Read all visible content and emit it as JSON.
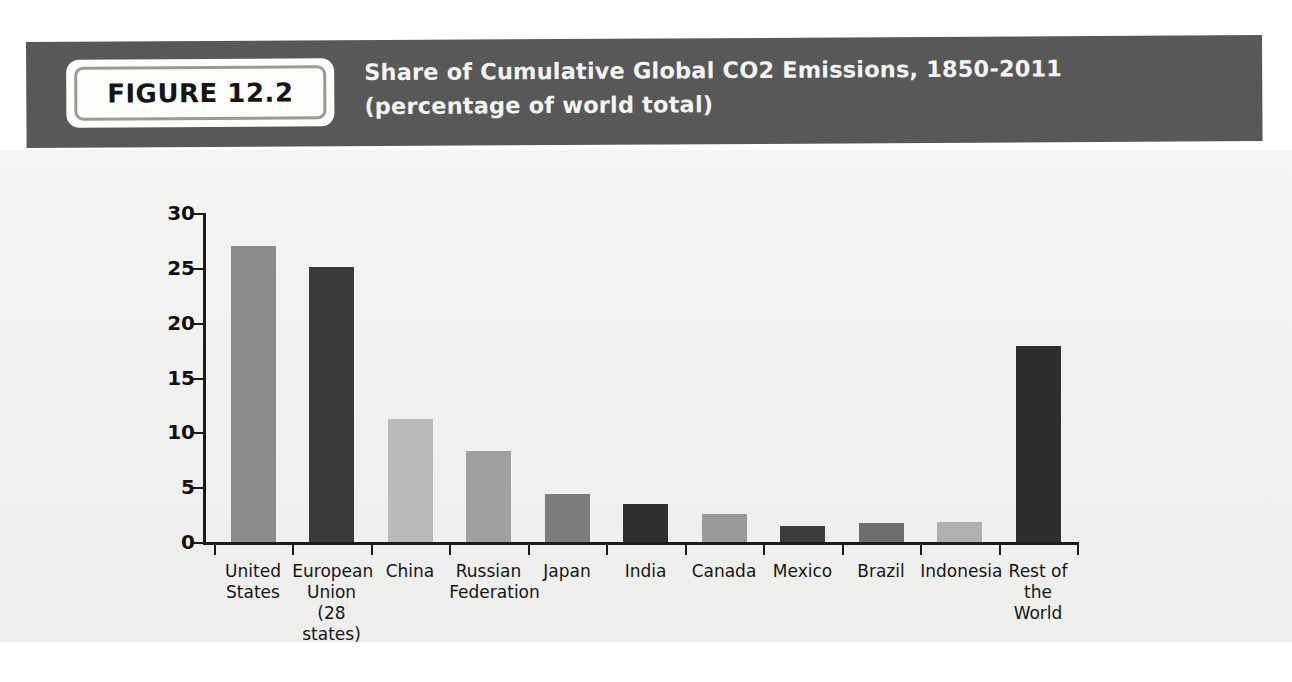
{
  "figure": {
    "badge_label": "FIGURE 12.2",
    "title_line1": "Share of Cumulative Global CO2 Emissions, 1850-2011",
    "title_line2": "(percentage of world total)"
  },
  "colors": {
    "header_band": "#585858",
    "header_text": "#f4f4f2",
    "badge_bg": "#fdfdfb",
    "badge_border": "#9a9a96",
    "axis": "#1b1b1b",
    "paper": "#f1f1ef"
  },
  "chart_data": {
    "type": "bar",
    "title": "Share of Cumulative Global CO2 Emissions, 1850-2011",
    "subtitle": "(percentage of world total)",
    "xlabel": "",
    "ylabel": "",
    "ylim": [
      0,
      30
    ],
    "yticks": [
      0,
      5,
      10,
      15,
      20,
      25,
      30
    ],
    "ytick_labels": [
      "0",
      "5",
      "10",
      "15",
      "20",
      "25",
      "30"
    ],
    "grid": false,
    "legend": "none",
    "categories": [
      "United\nStates",
      "European\nUnion\n(28 states)",
      "China",
      "Russian\nFederation",
      "Japan",
      "India",
      "Canada",
      "Mexico",
      "Brazil",
      "Indonesia",
      "Rest of\nthe World"
    ],
    "values": [
      27.0,
      25.1,
      11.2,
      8.3,
      4.4,
      3.5,
      2.6,
      1.5,
      1.7,
      1.8,
      17.9
    ],
    "bar_colors": [
      "#8b8b8b",
      "#3a3a3a",
      "#b9b9b9",
      "#a0a0a0",
      "#7c7c7c",
      "#2f2f2f",
      "#9a9a9a",
      "#3c3c3c",
      "#6e6e6e",
      "#b0b0b0",
      "#2e2e2e"
    ]
  }
}
